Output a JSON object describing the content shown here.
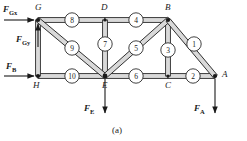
{
  "figure": {
    "caption": "(a)",
    "type": "truss-free-body-diagram"
  },
  "colors": {
    "member_stroke": "#2b2b2b",
    "member_fill": "#d9d9d9",
    "arrow": "#1a1a1a",
    "background": "#ffffff"
  },
  "nodes": [
    {
      "id": "G",
      "label": "G",
      "x": 38,
      "y": 20
    },
    {
      "id": "D",
      "label": "D",
      "x": 105,
      "y": 20
    },
    {
      "id": "B",
      "label": "B",
      "x": 168,
      "y": 20
    },
    {
      "id": "H",
      "label": "H",
      "x": 38,
      "y": 76
    },
    {
      "id": "E",
      "label": "E",
      "x": 105,
      "y": 76
    },
    {
      "id": "C",
      "label": "C",
      "x": 168,
      "y": 76
    },
    {
      "id": "A",
      "label": "A",
      "x": 215,
      "y": 76
    }
  ],
  "members": [
    {
      "number": "1",
      "from": "B",
      "to": "A",
      "badge_x": 194,
      "badge_y": 44
    },
    {
      "number": "2",
      "from": "C",
      "to": "A",
      "badge_x": 193,
      "badge_y": 76
    },
    {
      "number": "3",
      "from": "B",
      "to": "C",
      "badge_x": 168,
      "badge_y": 50
    },
    {
      "number": "4",
      "from": "D",
      "to": "B",
      "badge_x": 136,
      "badge_y": 20
    },
    {
      "number": "5",
      "from": "E",
      "to": "B",
      "badge_x": 136,
      "badge_y": 48
    },
    {
      "number": "6",
      "from": "E",
      "to": "C",
      "badge_x": 136,
      "badge_y": 76
    },
    {
      "number": "7",
      "from": "D",
      "to": "E",
      "badge_x": 105,
      "badge_y": 44
    },
    {
      "number": "8",
      "from": "G",
      "to": "D",
      "badge_x": 72,
      "badge_y": 20
    },
    {
      "number": "9",
      "from": "G",
      "to": "E",
      "badge_x": 72,
      "badge_y": 48
    },
    {
      "number": "10",
      "from": "H",
      "to": "E",
      "badge_x": 72,
      "badge_y": 76
    },
    {
      "number": "",
      "from": "G",
      "to": "H",
      "badge_x": 0,
      "badge_y": 0
    }
  ],
  "forces": [
    {
      "id": "FGx",
      "symbol": "F",
      "subscript": "Gx",
      "at_node": "G",
      "direction": "right"
    },
    {
      "id": "FGy",
      "symbol": "F",
      "subscript": "Gy",
      "at_node": "G",
      "direction": "up"
    },
    {
      "id": "FB",
      "symbol": "F",
      "subscript": "B",
      "at_node": "H",
      "direction": "right"
    },
    {
      "id": "FE",
      "symbol": "F",
      "subscript": "E",
      "at_node": "E",
      "direction": "down"
    },
    {
      "id": "FA",
      "symbol": "F",
      "subscript": "A",
      "at_node": "A",
      "direction": "down"
    }
  ]
}
